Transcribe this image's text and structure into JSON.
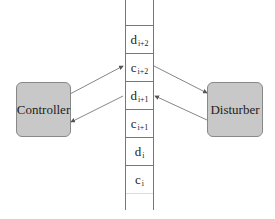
{
  "nodes": {
    "controller": {
      "label": "Controller"
    },
    "disturber": {
      "label": "Disturber"
    }
  },
  "tape": {
    "cells": [
      {
        "symbol": "d",
        "subscript": "i+2"
      },
      {
        "symbol": "c",
        "subscript": "i+2"
      },
      {
        "symbol": "d",
        "subscript": "i+1"
      },
      {
        "symbol": "c",
        "subscript": "i+1"
      },
      {
        "symbol": "d",
        "subscript": "i"
      },
      {
        "symbol": "c",
        "subscript": "i"
      }
    ]
  },
  "edges": [
    {
      "from": "controller",
      "to": "tape.c_i+2",
      "direction": "write"
    },
    {
      "from": "tape.d_i+1",
      "to": "controller",
      "direction": "read"
    },
    {
      "from": "tape.c_i+2",
      "to": "disturber",
      "direction": "read"
    },
    {
      "from": "disturber",
      "to": "tape.d_i+1",
      "direction": "write"
    }
  ],
  "colors": {
    "box_fill": "#c8c8c8",
    "line": "#666666"
  }
}
